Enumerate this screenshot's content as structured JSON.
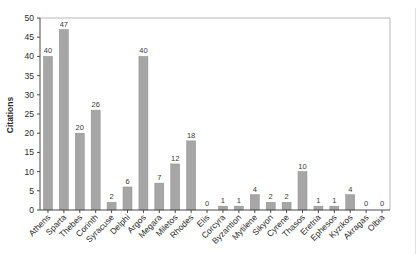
{
  "chart_data": {
    "type": "bar",
    "title": "",
    "xlabel": "",
    "ylabel": "Citations",
    "ylim": [
      0,
      50
    ],
    "ytick_step": 5,
    "grid": false,
    "legend": "none",
    "categories": [
      "Athens",
      "Sparta",
      "Thebes",
      "Corinth",
      "Syracuse",
      "Delphi",
      "Argos",
      "Megara",
      "Miletos",
      "Rhodes",
      "Elis",
      "Corcyra",
      "Byzantion",
      "Mytilene",
      "Sikyon",
      "Cyrene",
      "Thasos",
      "Eretria",
      "Ephesos",
      "Kyzikos",
      "Akragas",
      "Olbia"
    ],
    "values": [
      40,
      47,
      20,
      26,
      2,
      6,
      40,
      7,
      12,
      18,
      0,
      1,
      1,
      4,
      2,
      2,
      10,
      1,
      1,
      4,
      0,
      0
    ],
    "value_labels_shown": true,
    "colors": {
      "bar_fill": "#a6a6a6",
      "bar_edge": "#8e8e8e",
      "axis": "#4a4a4a",
      "frame": "#b8b8b8",
      "tick_text": "#2b2b2b",
      "value_text": "#3a3a3a",
      "background": "#ffffff"
    }
  }
}
